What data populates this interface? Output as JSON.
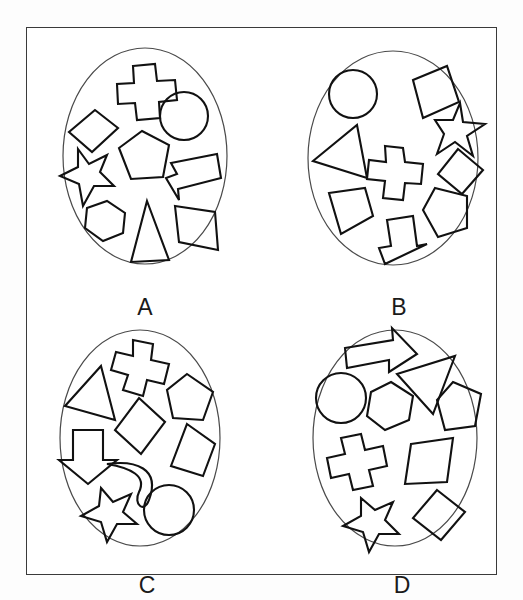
{
  "image": {
    "title": "Four circles of shapes comparison panels",
    "background_color": "#ffffff",
    "frame_color": "#3a3a3a",
    "shape_stroke_color": "#111111",
    "ellipse_stroke_color": "#4a4a4a",
    "label_color": "#1a1a1a",
    "panel_count": 4,
    "shapes_per_panel": 9
  },
  "panels": [
    {
      "id": "A",
      "label": "A",
      "shape_count": 9,
      "shapes": [
        "cross",
        "quadrilateral",
        "circle",
        "pentagon",
        "star",
        "arrow-left",
        "hexagon",
        "triangle",
        "parallelogram"
      ]
    },
    {
      "id": "B",
      "label": "B",
      "shape_count": 9,
      "shapes": [
        "circle",
        "quadrilateral",
        "star",
        "triangle",
        "cross",
        "diamond",
        "quadrilateral",
        "pentagon",
        "arrow-down"
      ]
    },
    {
      "id": "C",
      "label": "C",
      "shape_count": 9,
      "shapes": [
        "cross",
        "triangle",
        "pentagon",
        "diamond",
        "arrow-down",
        "quadrilateral",
        "crescent",
        "star",
        "circle"
      ]
    },
    {
      "id": "D",
      "label": "D",
      "shape_count": 9,
      "shapes": [
        "arrow-right",
        "triangle",
        "circle",
        "hexagon",
        "pentagon",
        "cross",
        "parallelogram",
        "star",
        "diamond"
      ]
    }
  ]
}
